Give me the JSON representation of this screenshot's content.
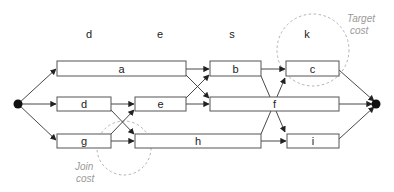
{
  "diagram": {
    "column_labels": [
      {
        "id": "col-d",
        "text": "d",
        "x": 89,
        "y": 38
      },
      {
        "id": "col-e",
        "text": "e",
        "x": 160,
        "y": 38
      },
      {
        "id": "col-s",
        "text": "s",
        "x": 232,
        "y": 38
      },
      {
        "id": "col-k",
        "text": "k",
        "x": 307,
        "y": 38
      }
    ],
    "nodes": {
      "start": {
        "x": 18,
        "y": 104
      },
      "end": {
        "x": 376,
        "y": 104
      }
    },
    "boxes": [
      {
        "id": "a",
        "label": "a",
        "x": 57,
        "y": 61,
        "w": 129,
        "h": 15
      },
      {
        "id": "b",
        "label": "b",
        "x": 210,
        "y": 61,
        "w": 51,
        "h": 15
      },
      {
        "id": "c",
        "label": "c",
        "x": 286,
        "y": 61,
        "w": 53,
        "h": 15
      },
      {
        "id": "d",
        "label": "d",
        "x": 57,
        "y": 97,
        "w": 54,
        "h": 14
      },
      {
        "id": "e",
        "label": "e",
        "x": 135,
        "y": 97,
        "w": 51,
        "h": 14
      },
      {
        "id": "f",
        "label": "f",
        "x": 210,
        "y": 97,
        "w": 129,
        "h": 14
      },
      {
        "id": "g",
        "label": "g",
        "x": 57,
        "y": 134,
        "w": 54,
        "h": 14
      },
      {
        "id": "h",
        "label": "h",
        "x": 135,
        "y": 134,
        "w": 126,
        "h": 14
      },
      {
        "id": "i",
        "label": "i",
        "x": 287,
        "y": 134,
        "w": 52,
        "h": 14
      }
    ],
    "edges": [
      {
        "from": "start",
        "to": "a"
      },
      {
        "from": "start",
        "to": "d"
      },
      {
        "from": "start",
        "to": "g"
      },
      {
        "from": "a",
        "to": "b"
      },
      {
        "from": "a",
        "to": "f"
      },
      {
        "from": "d",
        "to": "e"
      },
      {
        "from": "d",
        "to": "h"
      },
      {
        "from": "g",
        "to": "e"
      },
      {
        "from": "g",
        "to": "h"
      },
      {
        "from": "e",
        "to": "b"
      },
      {
        "from": "e",
        "to": "f"
      },
      {
        "from": "b",
        "to": "c"
      },
      {
        "from": "b",
        "to": "i"
      },
      {
        "from": "h",
        "to": "c"
      },
      {
        "from": "h",
        "to": "i"
      },
      {
        "from": "c",
        "to": "end"
      },
      {
        "from": "f",
        "to": "end"
      },
      {
        "from": "i",
        "to": "end"
      }
    ],
    "annotations": {
      "target_cost": {
        "line1": "Target",
        "line2": "cost",
        "circle": {
          "cx": 313,
          "cy": 50,
          "r": 36
        }
      },
      "join_cost": {
        "line1": "Join",
        "line2": "cost",
        "circle": {
          "cx": 124,
          "cy": 148,
          "r": 27
        }
      }
    }
  }
}
